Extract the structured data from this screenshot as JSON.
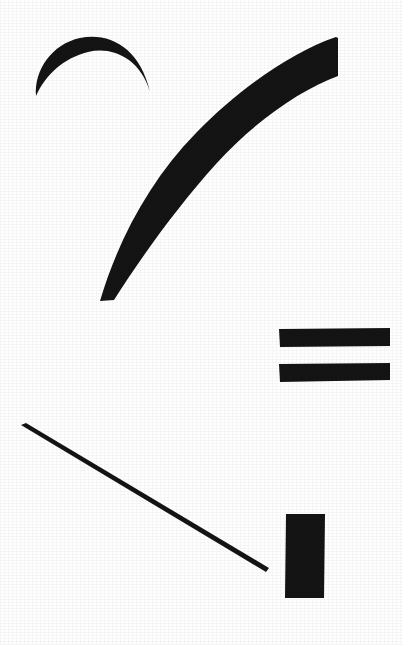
{
  "image": {
    "title": "Abstract Ink Brush Strokes",
    "description": "Five solid black brush-stroke marks arranged on a plain white background",
    "width": 403,
    "height": 645,
    "background_color": "#ffffff",
    "ink_color": "#141414",
    "medium": "scanned black ink on white paper"
  },
  "strokes": [
    {
      "id": "crescent-arc",
      "label": "crescent arc",
      "shape_type": "crescent",
      "fill": "#141414",
      "bbox": {
        "x": 33,
        "y": 36,
        "width": 118,
        "height": 60
      },
      "path": "M 36 96 C 34 70 52 44 80 38 C 110 32 140 48 150 92 C 140 58 112 46 88 52 C 64 58 46 74 36 96 Z"
    },
    {
      "id": "tapered-swoosh",
      "label": "large tapered swoosh",
      "shape_type": "tapered-curve",
      "fill": "#141414",
      "bbox": {
        "x": 99,
        "y": 36,
        "width": 239,
        "height": 266
      },
      "path": "M 100 301 C 118 240 150 180 196 133 C 240 88 292 52 336 37 L 338 38 L 338 76 C 300 90 254 122 216 164 C 178 206 142 256 114 300 L 100 301 Z"
    },
    {
      "id": "equals-bar-upper",
      "label": "upper horizontal bar",
      "shape_type": "rectangle",
      "fill": "#141414",
      "bbox": {
        "x": 279,
        "y": 328,
        "width": 111,
        "height": 19
      },
      "path": "M 279 329 L 390 328 L 390 346 L 280 347 Z"
    },
    {
      "id": "equals-bar-lower",
      "label": "lower horizontal bar",
      "shape_type": "rectangle",
      "fill": "#141414",
      "bbox": {
        "x": 279,
        "y": 363,
        "width": 111,
        "height": 19
      },
      "path": "M 279 364 L 390 363 L 390 380 L 280 382 Z"
    },
    {
      "id": "diagonal-line",
      "label": "thin diagonal line",
      "shape_type": "line",
      "fill": "#141414",
      "bbox": {
        "x": 21,
        "y": 424,
        "width": 248,
        "height": 147
      },
      "path": "M 21 425 L 26 423 L 269 568 L 266 572 Z"
    },
    {
      "id": "vertical-block",
      "label": "vertical rectangle block",
      "shape_type": "rectangle",
      "fill": "#141414",
      "bbox": {
        "x": 285,
        "y": 513,
        "width": 40,
        "height": 86
      },
      "path": "M 286 514 L 325 514 L 324 598 L 285 598 Z"
    }
  ]
}
